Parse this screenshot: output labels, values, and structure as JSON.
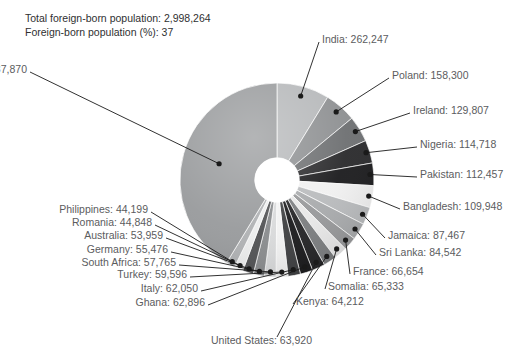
{
  "top_ghost_text": "",
  "header": {
    "total_label": "Total foreign-born population: 2,998,264",
    "percent_label": "Foreign-born population (%): 37"
  },
  "colors": {
    "background": "#ffffff",
    "text": "#58595b",
    "header_text": "#2f3031",
    "leader_line": "#1a1a1a",
    "hole": "#ffffff"
  },
  "chart_data": {
    "type": "pie",
    "variant": "donut",
    "title": "",
    "subtitle": "",
    "xlabel": "",
    "ylabel": "",
    "grid": false,
    "legend_position": "callout-labels",
    "total": 2998264,
    "total_label": "Total foreign-born population: 2,998,264",
    "percent_of_population": 37,
    "start_angle_deg": 0,
    "direction": "clockwise",
    "inner_radius_ratio": 0.23,
    "labels": [
      "India",
      "Poland",
      "Ireland",
      "Nigeria",
      "Pakistan",
      "Bangladesh",
      "Jamaica",
      "Sri Lanka",
      "France",
      "Somalia",
      "Kenya",
      "United States",
      "Ghana",
      "Italy",
      "Turkey",
      "South Africa",
      "Germany",
      "Australia",
      "Romania",
      "Philippines",
      "Other countries"
    ],
    "values": [
      262247,
      158300,
      129807,
      114718,
      112457,
      109948,
      87467,
      84542,
      66654,
      65333,
      64212,
      63920,
      62896,
      62050,
      59596,
      57765,
      55476,
      53959,
      44848,
      44199,
      1237870
    ],
    "slice_colors": [
      "#b6b8ba",
      "#8e9092",
      "#6e7072",
      "#2b2b2d",
      "#1d1d1f",
      "#f0f0f0",
      "#b9bbbd",
      "#a9abad",
      "#98999b",
      "#e8e8e8",
      "#7c7e80",
      "#252527",
      "#1b1b1d",
      "#3f4042",
      "#f2f2f2",
      "#d9dadb",
      "#8a8c8e",
      "#525355",
      "#eceded",
      "#b0b2b4",
      "#999b9d"
    ],
    "callouts": [
      {
        "label": "India: 262,247",
        "side": "right"
      },
      {
        "label": "Poland: 158,300",
        "side": "right"
      },
      {
        "label": "Ireland: 129,807",
        "side": "right"
      },
      {
        "label": "Nigeria: 114,718",
        "side": "right"
      },
      {
        "label": "Pakistan: 112,457",
        "side": "right"
      },
      {
        "label": "Bangladesh: 109,948",
        "side": "right"
      },
      {
        "label": "Jamaica: 87,467",
        "side": "right"
      },
      {
        "label": "Sri Lanka: 84,542",
        "side": "right"
      },
      {
        "label": "France: 66,654",
        "side": "right"
      },
      {
        "label": "Somalia: 65,333",
        "side": "right"
      },
      {
        "label": "Kenya: 64,212",
        "side": "right"
      },
      {
        "label": "United States: 63,920",
        "side": "center"
      },
      {
        "label": "Ghana: 62,896",
        "side": "left"
      },
      {
        "label": "Italy: 62,050",
        "side": "left"
      },
      {
        "label": "Turkey: 59,596",
        "side": "left"
      },
      {
        "label": "South Africa: 57,765",
        "side": "left"
      },
      {
        "label": "Germany: 55,476",
        "side": "left"
      },
      {
        "label": "Australia: 53,959",
        "side": "left"
      },
      {
        "label": "Romania: 44,848",
        "side": "left"
      },
      {
        "label": "Philippines: 44,199",
        "side": "left"
      },
      {
        "label": "Other countries: 1,237,870",
        "side": "left"
      }
    ]
  }
}
